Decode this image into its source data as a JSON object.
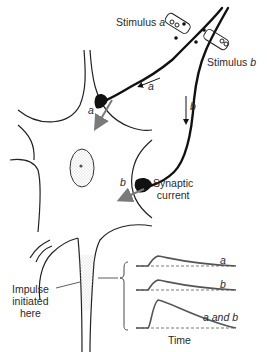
{
  "diagram": {
    "type": "neuron-synaptic-summation",
    "colors": {
      "ink": "#111111",
      "arrow_gray": "#7a7a7a",
      "trace": "#555555",
      "stipple": "#9a9a9a"
    },
    "labels": {
      "stimulus_a": "Stimulus",
      "stimulus_a_letter": "a",
      "stimulus_b": "Stimulus",
      "stimulus_b_letter": "b",
      "axon_arrow_a": "a",
      "axon_arrow_b": "b",
      "current_a": "a",
      "current_b": "b",
      "synaptic_current_line1": "Synaptic",
      "synaptic_current_line2": "current",
      "impulse_line1": "Impulse",
      "impulse_line2": "initiated",
      "impulse_line3": "here"
    },
    "traces": {
      "x_axis_label": "Time",
      "items": [
        {
          "label": "a",
          "relative_amplitude": 1.0
        },
        {
          "label": "b",
          "relative_amplitude": 1.0
        },
        {
          "label": "a and b",
          "relative_amplitude": 2.0
        }
      ]
    }
  }
}
